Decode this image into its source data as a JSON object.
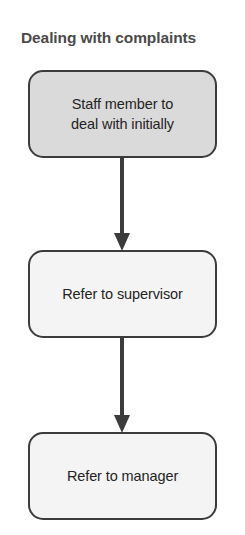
{
  "diagram": {
    "title": "Dealing with complaints",
    "title_color": "#4b4b4b",
    "background_color": "#ffffff",
    "arrow_color": "#3c3c3c",
    "nodes": [
      {
        "id": "staff-member",
        "label": "Staff member to\ndeal with initially",
        "fill": "#dadada",
        "border": "#3c3c3c",
        "shape": "rounded-rectangle"
      },
      {
        "id": "refer-supervisor",
        "label": "Refer to supervisor",
        "fill": "#f4f4f4",
        "border": "#3c3c3c",
        "shape": "rounded-rectangle"
      },
      {
        "id": "refer-manager",
        "label": "Refer to manager",
        "fill": "#f4f4f4",
        "border": "#3c3c3c",
        "shape": "rounded-rectangle"
      }
    ],
    "connectors": [
      {
        "id": "staff-to-supervisor",
        "from": "staff-member",
        "to": "refer-supervisor",
        "direction": "down",
        "style": "solid-arrow"
      },
      {
        "id": "supervisor-to-manager",
        "from": "refer-supervisor",
        "to": "refer-manager",
        "direction": "down",
        "style": "solid-arrow"
      }
    ]
  }
}
